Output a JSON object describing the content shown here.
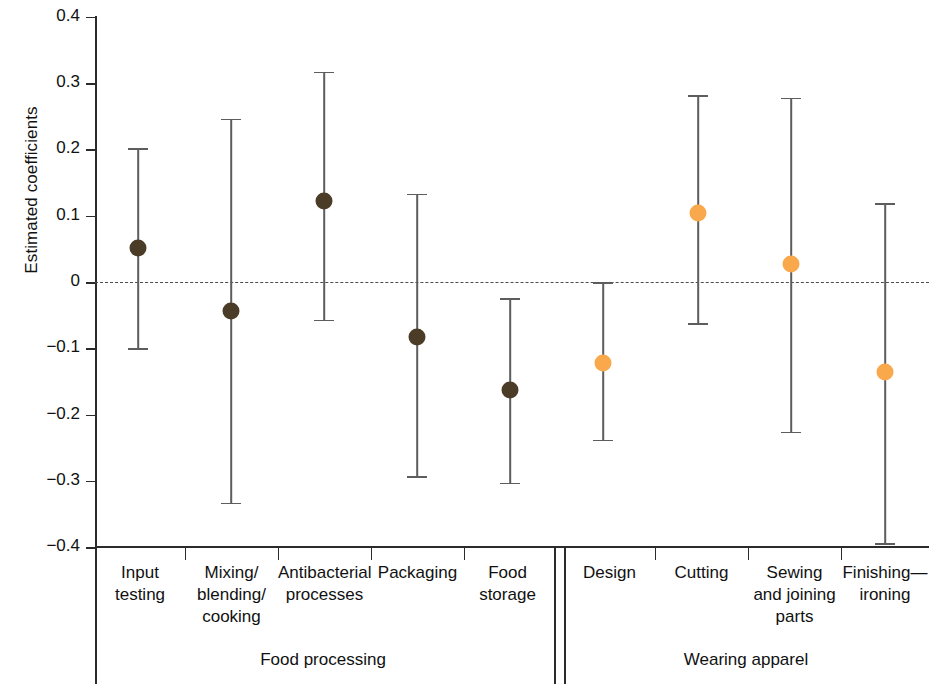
{
  "chart_data": {
    "type": "scatter",
    "title": "",
    "xlabel": "",
    "ylabel": "Estimated coefficients",
    "ylim": [
      -0.4,
      0.4
    ],
    "yticks": [
      "0.4",
      "0.3",
      "0.2",
      "0.1",
      "0",
      "−0.1",
      "−0.2",
      "−0.3",
      "−0.4"
    ],
    "ytick_values": [
      0.4,
      0.3,
      0.2,
      0.1,
      0,
      -0.1,
      -0.2,
      -0.3,
      -0.4
    ],
    "grid": false,
    "legend": "none",
    "zero_reference_line": 0,
    "categories": [
      "Input testing",
      "Mixing/ blending/ cooking",
      "Antibacterial processes",
      "Packaging",
      "Food storage",
      "Design",
      "Cutting",
      "Sewing and joining parts",
      "Finishing—ironing"
    ],
    "values": [
      0.051,
      -0.044,
      0.122,
      -0.083,
      -0.163,
      -0.122,
      0.104,
      0.027,
      -0.136
    ],
    "ci_lower": [
      -0.1,
      -0.333,
      -0.057,
      -0.293,
      -0.303,
      -0.238,
      -0.062,
      -0.226,
      -0.394
    ],
    "ci_upper": [
      0.202,
      0.246,
      0.317,
      0.133,
      -0.024,
      0.0,
      0.282,
      0.278,
      0.119
    ],
    "groups": [
      {
        "name": "Food processing",
        "categories": [
          0,
          1,
          2,
          3,
          4
        ],
        "color": "#4b3c28"
      },
      {
        "name": "Wearing apparel",
        "categories": [
          5,
          6,
          7,
          8
        ],
        "color": "#f9a councilB"
      }
    ],
    "series": [
      {
        "name": "Food processing",
        "color": "#4b3c28",
        "points": [
          {
            "label": "Input testing",
            "estimate": 0.051,
            "lower": -0.1,
            "upper": 0.202
          },
          {
            "label": "Mixing/ blending/ cooking",
            "estimate": -0.044,
            "lower": -0.333,
            "upper": 0.246
          },
          {
            "label": "Antibacterial processes",
            "estimate": 0.122,
            "lower": -0.057,
            "upper": 0.317
          },
          {
            "label": "Packaging",
            "estimate": -0.083,
            "lower": -0.293,
            "upper": 0.133
          },
          {
            "label": "Food storage",
            "estimate": -0.163,
            "lower": -0.303,
            "upper": -0.024
          }
        ]
      },
      {
        "name": "Wearing apparel",
        "color": "#f9a94b",
        "points": [
          {
            "label": "Design",
            "estimate": -0.122,
            "lower": -0.238,
            "upper": 0.0
          },
          {
            "label": "Cutting",
            "estimate": 0.104,
            "lower": -0.062,
            "upper": 0.282
          },
          {
            "label": "Sewing and joining parts",
            "estimate": 0.027,
            "lower": -0.226,
            "upper": 0.278
          },
          {
            "label": "Finishing—ironing",
            "estimate": -0.136,
            "lower": -0.394,
            "upper": 0.119
          }
        ]
      }
    ]
  },
  "axis": {
    "y_title": "Estimated coefficients",
    "ticks": [
      {
        "label": "0.4",
        "value": 0.4
      },
      {
        "label": "0.3",
        "value": 0.3
      },
      {
        "label": "0.2",
        "value": 0.2
      },
      {
        "label": "0.1",
        "value": 0.1
      },
      {
        "label": "0",
        "value": 0
      },
      {
        "label": "−0.1",
        "value": -0.1
      },
      {
        "label": "−0.2",
        "value": -0.2
      },
      {
        "label": "−0.3",
        "value": -0.3
      },
      {
        "label": "−0.4",
        "value": -0.4
      }
    ]
  },
  "categories": [
    {
      "line1": "Input",
      "line2": "testing",
      "line3": ""
    },
    {
      "line1": "Mixing/",
      "line2": "blending/",
      "line3": "cooking"
    },
    {
      "line1": "Antibacterial",
      "line2": "processes",
      "line3": ""
    },
    {
      "line1": "Packaging",
      "line2": "",
      "line3": ""
    },
    {
      "line1": "Food",
      "line2": "storage",
      "line3": ""
    },
    {
      "line1": "Design",
      "line2": "",
      "line3": ""
    },
    {
      "line1": "Cutting",
      "line2": "",
      "line3": ""
    },
    {
      "line1": "Sewing",
      "line2": "and joining",
      "line3": "parts"
    },
    {
      "line1": "Finishing—",
      "line2": "ironing",
      "line3": ""
    }
  ],
  "groups": [
    {
      "label": "Food processing"
    },
    {
      "label": "Wearing apparel"
    }
  ],
  "colors": {
    "food_processing_marker": "#4b3c28",
    "wearing_apparel_marker": "#f9a94b",
    "errorbar": "#5d5d5d",
    "axis": "#2b2b2b",
    "zero_line": "#4d4d4d",
    "background": "#ffffff"
  }
}
